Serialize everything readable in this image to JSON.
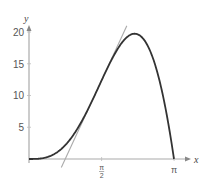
{
  "chart_data": {
    "type": "line",
    "title": "",
    "xlabel": "x",
    "ylabel": "y",
    "xlim": [
      0,
      3.3
    ],
    "ylim": [
      0,
      21
    ],
    "grid": false,
    "x_ticks": [
      {
        "value": 1.5708,
        "label": "π/2",
        "num": "π",
        "den": "2"
      },
      {
        "value": 3.1416,
        "label": "π"
      }
    ],
    "y_ticks": [
      {
        "value": 5,
        "label": "5"
      },
      {
        "value": 10,
        "label": "10"
      },
      {
        "value": 15,
        "label": "15"
      },
      {
        "value": 20,
        "label": "20"
      }
    ],
    "series": [
      {
        "name": "f(x) = 5x² sin x",
        "color": "#333333",
        "x_range": [
          0,
          3.1416
        ],
        "peak": {
          "x": 2.29,
          "y": 19.7
        }
      },
      {
        "name": "tangent line at x = π/2",
        "color": "#aaaaaa",
        "point": {
          "x": 1.5708,
          "y": 12.34
        },
        "slope": 15.71,
        "x_intercept": 0.785
      }
    ]
  },
  "axes": {
    "x_label": "x",
    "y_label": "y",
    "tick_pi_half_num": "π",
    "tick_pi_half_den": "2",
    "tick_pi": "π",
    "y_tick_5": "5",
    "y_tick_10": "10",
    "y_tick_15": "15",
    "y_tick_20": "20"
  },
  "colors": {
    "curve": "#333333",
    "tangent": "#aaaaaa",
    "axis": "#999999"
  }
}
